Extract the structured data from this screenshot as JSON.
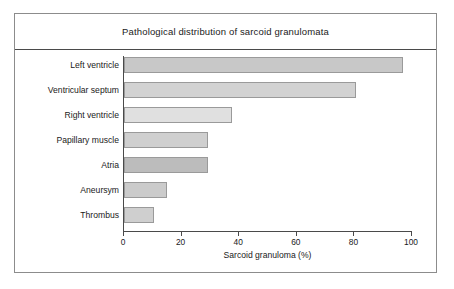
{
  "chart_data": {
    "type": "bar",
    "orientation": "horizontal",
    "title": "Pathological distribution of sarcoid granulomata",
    "xlabel": "Sarcoid granuloma (%)",
    "ylabel": "",
    "xlim": [
      0,
      100
    ],
    "xticks": [
      0,
      20,
      40,
      60,
      80,
      100
    ],
    "grid": false,
    "legend": null,
    "categories": [
      "Left ventricle",
      "Ventricular septum",
      "Right ventricle",
      "Papillary muscle",
      "Atria",
      "Aneursym",
      "Thrombus"
    ],
    "values": [
      97,
      80.5,
      37.5,
      29,
      29,
      15,
      10.5
    ],
    "bar_colors": [
      "#c8c8c8",
      "#d2d2d2",
      "#e0e0e0",
      "#cfcfcf",
      "#bcbcbc",
      "#cbcbcb",
      "#cfcfcf"
    ],
    "bar_border_color": "#9a9a9a",
    "axis_color": "#4a4a4a",
    "frame_color": "#8c8c8c",
    "background": "#ffffff"
  }
}
